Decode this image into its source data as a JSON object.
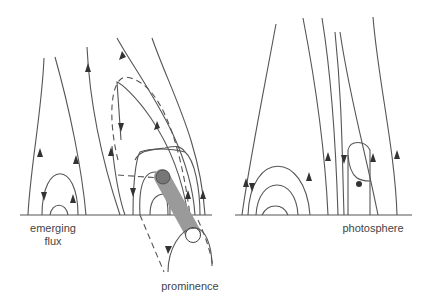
{
  "labels": {
    "emerging_flux_line1": "emerging",
    "emerging_flux_line2": "flux",
    "prominence": "prominence",
    "photosphere": "photosphere"
  },
  "colors": {
    "line": "#555555",
    "prominence_fill": "#9a9a9a",
    "prominence_top": "#777777",
    "background": "#ffffff"
  }
}
